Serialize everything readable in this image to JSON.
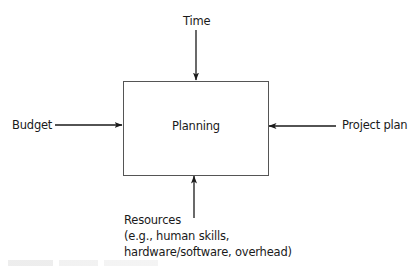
{
  "diagram": {
    "type": "input-process diagram",
    "process": {
      "label": "Planning"
    },
    "inputs": {
      "top": {
        "label": "Time",
        "direction": "down"
      },
      "left": {
        "label": "Budget",
        "direction": "right"
      },
      "right": {
        "label": "Project plan",
        "direction": "left"
      },
      "bottom": {
        "lines": [
          "Resources",
          "(e.g., human skills,",
          "hardware/software, overhead)"
        ],
        "direction": "up"
      }
    },
    "colors": {
      "stroke": "#1a1a1a",
      "box_border": "#555555",
      "background": "#ffffff"
    }
  }
}
